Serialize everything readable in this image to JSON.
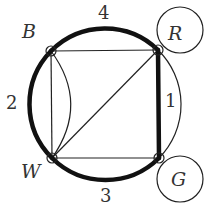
{
  "diagram": {
    "colors": {
      "stroke": "#111111",
      "label": "#333333",
      "background": "#ffffff"
    },
    "vertices": [
      {
        "id": "B",
        "label": "B",
        "x": 51,
        "y": 51,
        "label_x": 30,
        "label_y": 38
      },
      {
        "id": "R",
        "label": "R",
        "x": 158,
        "y": 50,
        "label_x": 176,
        "label_y": 40
      },
      {
        "id": "W",
        "label": "W",
        "x": 52,
        "y": 158,
        "label_x": 32,
        "label_y": 178
      },
      {
        "id": "G",
        "label": "G",
        "x": 159,
        "y": 158,
        "label_x": 178,
        "label_y": 186
      }
    ],
    "thick_edges": [
      {
        "name": "arc-B-R",
        "label": "4",
        "label_x": 104,
        "label_y": 19
      },
      {
        "name": "arc-B-W",
        "label": "2",
        "label_x": 12,
        "label_y": 109
      },
      {
        "name": "line-R-G",
        "label": "1",
        "label_x": 170,
        "label_y": 108
      },
      {
        "name": "arc-W-G",
        "label": "3",
        "label_x": 105,
        "label_y": 202
      }
    ],
    "thin_edges": [
      {
        "name": "line-B-R"
      },
      {
        "name": "line-B-W"
      },
      {
        "name": "curve-B-W"
      },
      {
        "name": "line-W-R"
      },
      {
        "name": "line-W-G"
      },
      {
        "name": "arc-R-G-outer"
      },
      {
        "name": "loop-R"
      },
      {
        "name": "loop-G"
      }
    ]
  }
}
